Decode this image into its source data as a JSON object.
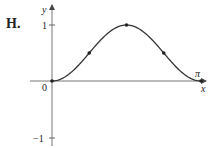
{
  "panel_label": "H.",
  "chart_data": {
    "type": "line",
    "title": "",
    "xlabel": "x",
    "ylabel": "y",
    "x_tick_labels": [
      "0",
      "π"
    ],
    "y_tick_labels": [
      "1",
      "−1"
    ],
    "xlim": [
      0,
      3.1416
    ],
    "ylim": [
      -1,
      1
    ],
    "grid": false,
    "legend": null,
    "function_shape": "sin²(x)",
    "series": [
      {
        "name": "curve",
        "x": [
          0,
          0.3927,
          0.7854,
          1.1781,
          1.5708,
          1.9635,
          2.3562,
          2.7489,
          3.1416
        ],
        "y": [
          0,
          0.146,
          0.5,
          0.854,
          1,
          0.854,
          0.5,
          0.146,
          0
        ]
      }
    ],
    "marked_points": [
      {
        "x": 0,
        "y": 0,
        "label": "origin"
      },
      {
        "x": 0.7854,
        "y": 0.5,
        "label": "inflection"
      },
      {
        "x": 1.5708,
        "y": 1,
        "label": "maximum"
      },
      {
        "x": 2.3562,
        "y": 0.5,
        "label": "inflection"
      },
      {
        "x": 3.1416,
        "y": 0,
        "label": "endpoint"
      }
    ]
  },
  "colors": {
    "axis": "#555555",
    "curve": "#333333",
    "text": "#222222"
  }
}
